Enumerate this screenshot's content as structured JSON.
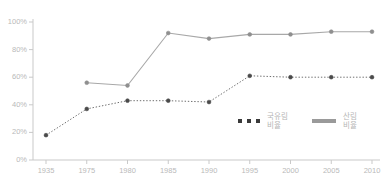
{
  "chart_data": {
    "type": "line",
    "title": "",
    "subtitle": "",
    "xlabel": "",
    "ylabel": "",
    "categories": [
      "1935",
      "1975",
      "1980",
      "1985",
      "1990",
      "1995",
      "2000",
      "2005",
      "2010"
    ],
    "x_tick_labels": [
      "1935",
      "1975",
      "1980",
      "1985",
      "1990",
      "1995",
      "2000",
      "2005",
      "2010"
    ],
    "y_tick_labels": [
      "0%",
      "20%",
      "40%",
      "60%",
      "80%",
      "100%"
    ],
    "y_ticks": [
      0,
      20,
      40,
      60,
      80,
      100
    ],
    "ylim": [
      0,
      100
    ],
    "grid": false,
    "legend_position": "inside-bottom-right",
    "series": [
      {
        "name": "국유림 비율",
        "style": "dotted",
        "color": "#6e6e6e",
        "marker": "circle",
        "values": [
          18,
          37,
          43,
          43,
          42,
          61,
          60,
          60,
          60
        ]
      },
      {
        "name": "산림 비율",
        "style": "solid",
        "color": "#a8a8a8",
        "marker": "circle",
        "values": [
          null,
          56,
          54,
          92,
          88,
          91,
          91,
          93,
          93
        ]
      }
    ]
  },
  "legend": {
    "entries": [
      {
        "label_line1": "국유림",
        "label_line2": "비율",
        "swatch": "dotted-marker-swatch"
      },
      {
        "label_line1": "산림",
        "label_line2": "비율",
        "swatch": "solid-line-swatch"
      }
    ]
  },
  "colors": {
    "dotted_series": "#6e6e6e",
    "solid_series": "#a8a8a8",
    "axis": "#c9c9c9",
    "tick_text": "#b9b9b9"
  }
}
